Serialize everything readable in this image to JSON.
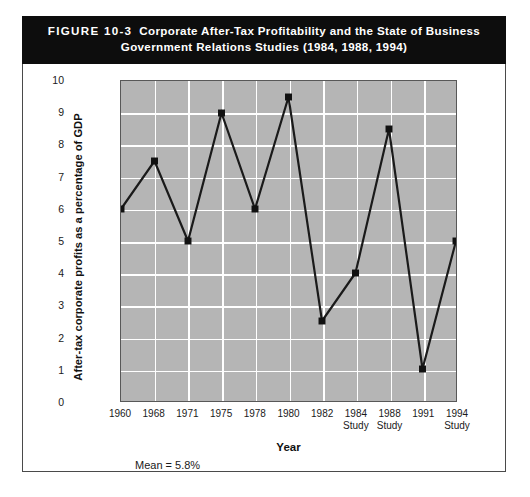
{
  "figure": {
    "number_label": "FIGURE 10-3",
    "title_line1": "Corporate After-Tax Profitability and the State of Business",
    "title_line2": "Government Relations Studies (1984, 1988, 1994)"
  },
  "notes": {
    "mean": "Mean = 5.8%"
  },
  "colors": {
    "header_background": "#0d0d0d",
    "header_text": "#ffffff",
    "plot_background": "#b5b5b5",
    "gridline": "#ffffff",
    "series_line": "#1a1a1a",
    "marker": "#111111",
    "frame_border": "#4a4a4a"
  },
  "chart_data": {
    "type": "line",
    "title": "Corporate After-Tax Profitability and the State of Business Government Relations Studies (1984, 1988, 1994)",
    "xlabel": "Year",
    "ylabel": "After-tax corporate profits as a percentage of GDP",
    "categories": [
      "1960",
      "1968",
      "1971",
      "1975",
      "1978",
      "1980",
      "1982",
      "1984",
      "1988",
      "1991",
      "1994"
    ],
    "category_sublabels": [
      "",
      "",
      "",
      "",
      "",
      "",
      "",
      "Study",
      "Study",
      "",
      "Study"
    ],
    "values": [
      6.0,
      7.5,
      5.0,
      9.0,
      6.0,
      9.5,
      2.5,
      4.0,
      8.5,
      1.0,
      5.0
    ],
    "ylim": [
      0,
      10
    ],
    "yticks": [
      "10",
      "9",
      "8",
      "7",
      "6",
      "5",
      "4",
      "3",
      "2",
      "1",
      "0"
    ],
    "ytick_values": [
      10,
      9,
      8,
      7,
      6,
      5,
      4,
      3,
      2,
      1,
      0
    ],
    "grid": true,
    "legend": "none",
    "marker": "square",
    "annotations": [
      "Mean = 5.8%"
    ]
  }
}
